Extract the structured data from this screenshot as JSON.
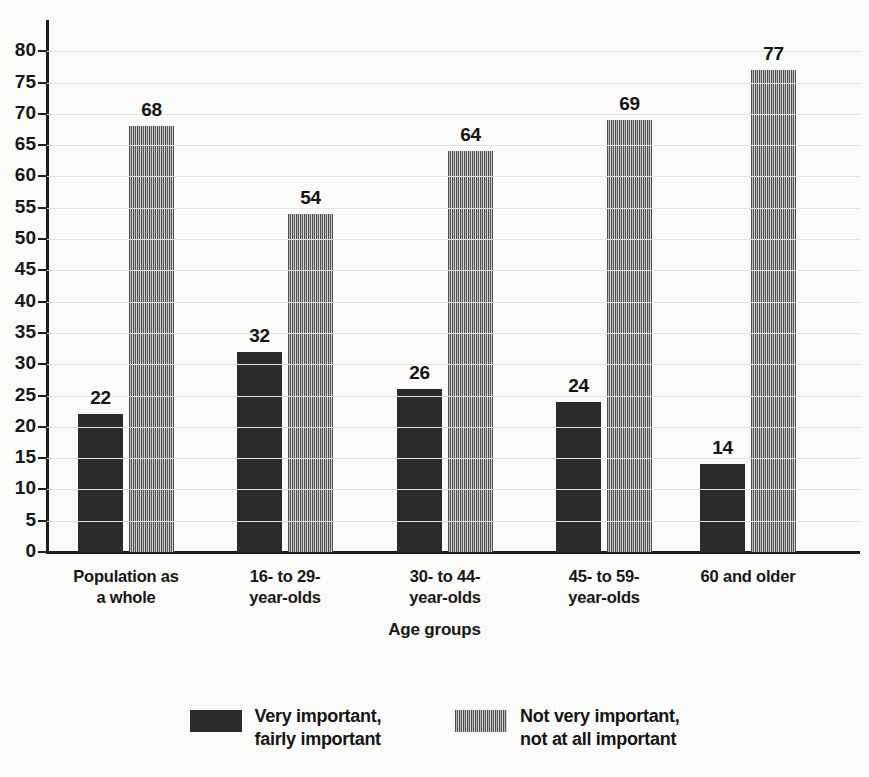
{
  "chart_data": {
    "type": "bar",
    "title": "",
    "subtitle": "",
    "xlabel": "Age groups",
    "ylabel": "",
    "ylim": [
      0,
      85
    ],
    "yticks": [
      0,
      5,
      10,
      15,
      20,
      25,
      30,
      35,
      40,
      45,
      50,
      55,
      60,
      65,
      70,
      75,
      80
    ],
    "grid": true,
    "legend_position": "bottom",
    "categories": [
      "Population as a whole",
      "16- to 29-year-olds",
      "30- to 44-year-olds",
      "45- to 59-year-olds",
      "60 and older"
    ],
    "category_lines": [
      [
        "Population as",
        "a whole"
      ],
      [
        "16- to 29-",
        "year-olds"
      ],
      [
        "30- to 44-",
        "year-olds"
      ],
      [
        "45- to 59-",
        "year-olds"
      ],
      [
        "60 and older",
        ""
      ]
    ],
    "series": [
      {
        "name": "Very important, fairly important",
        "name_lines": [
          "Very important,",
          "fairly important"
        ],
        "pattern": "solid",
        "color": "#2b2b2b",
        "values": [
          22,
          32,
          26,
          24,
          14
        ]
      },
      {
        "name": "Not very important, not at all important",
        "name_lines": [
          "Not very important,",
          "not at all important"
        ],
        "pattern": "vertical-stripes",
        "color": "#7a7a7a",
        "values": [
          68,
          54,
          64,
          69,
          77
        ]
      }
    ]
  },
  "axis": {
    "x_title": "Age groups"
  },
  "ytick_labels": [
    "80",
    "75",
    "70",
    "65",
    "60",
    "55",
    "50",
    "45",
    "40",
    "35",
    "30",
    "25",
    "20",
    "15",
    "10",
    "5",
    "0"
  ],
  "bar_labels": {
    "g0s0": "22",
    "g0s1": "68",
    "g1s0": "32",
    "g1s1": "54",
    "g2s0": "26",
    "g2s1": "64",
    "g3s0": "24",
    "g3s1": "69",
    "g4s0": "14",
    "g4s1": "77"
  },
  "legend": {
    "items": [
      {
        "line1": "Very important,",
        "line2": "fairly important",
        "swatch": "solid-swatch"
      },
      {
        "line1": "Not very important,",
        "line2": "not at all important",
        "swatch": "striped-swatch"
      }
    ]
  }
}
